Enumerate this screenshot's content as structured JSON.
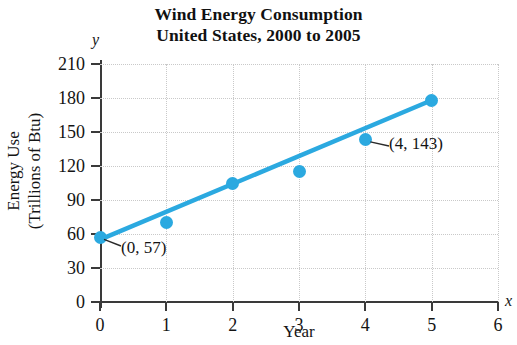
{
  "chart_data": {
    "type": "scatter",
    "title": "Wind Energy Consumption",
    "subtitle": "United States, 2000 to 2005",
    "xlabel": "Year",
    "ylabel_line1": "Energy Use",
    "ylabel_line2": "(Trillions of Btu)",
    "x_axis_letter": "x",
    "y_axis_letter": "y",
    "xlim": [
      0,
      6
    ],
    "ylim": [
      0,
      210
    ],
    "xticks": [
      "0",
      "1",
      "2",
      "3",
      "4",
      "5",
      "6"
    ],
    "yticks": [
      "0",
      "30",
      "60",
      "90",
      "120",
      "150",
      "180",
      "210"
    ],
    "grid": true,
    "legend": "none",
    "series": [
      {
        "name": "Wind energy consumption",
        "marker_color": "#2BA9E0",
        "line_color": "#2BA9E0",
        "x": [
          0,
          1,
          2,
          3,
          4,
          5
        ],
        "values": [
          57,
          70,
          105,
          115,
          143,
          178
        ]
      }
    ],
    "trend_line": {
      "description": "best fit line drawn through the data points",
      "x_start": 0,
      "y_start": 55,
      "x_end": 5,
      "y_end": 178,
      "color": "#2BA9E0"
    },
    "annotations": [
      {
        "label": "(0, 57)",
        "point_x": 0,
        "point_y": 57
      },
      {
        "label": "(4, 143)",
        "point_x": 4,
        "point_y": 143
      }
    ]
  }
}
